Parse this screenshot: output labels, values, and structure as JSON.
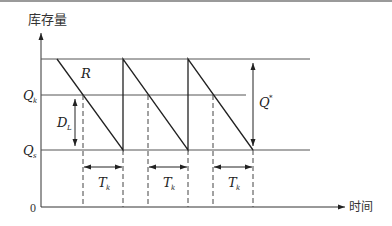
{
  "diagram": {
    "type": "inventory-sawtooth",
    "y_axis_label": "库存量",
    "x_axis_label": "时间",
    "origin_label": "0",
    "levels": {
      "top": {
        "name": "max-level",
        "label": ""
      },
      "reorder": {
        "name": "Q_k",
        "label_main": "Q",
        "label_sub": "k"
      },
      "safety": {
        "name": "Q_s",
        "label_main": "Q",
        "label_sub": "s"
      }
    },
    "annotations": {
      "rate": "R",
      "lead_demand": {
        "main": "D",
        "sub": "L"
      },
      "order_qty": {
        "main": "Q",
        "sup": "*"
      },
      "lead_time": {
        "main": "T",
        "sub": "k"
      }
    },
    "cycles": 3,
    "line_color": "#222222",
    "axis_color": "#333333",
    "grid_color": "#555555"
  }
}
